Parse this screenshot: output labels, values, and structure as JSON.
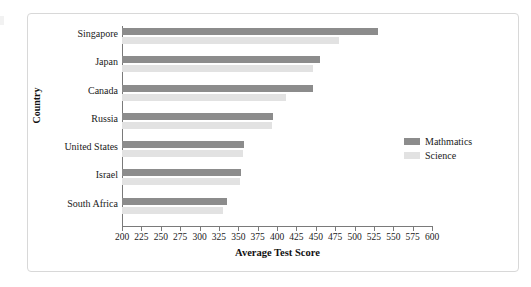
{
  "chart_data": {
    "type": "bar",
    "orientation": "horizontal",
    "title": "",
    "xlabel": "Average Test Score",
    "ylabel": "Country",
    "xlim": [
      200,
      600
    ],
    "xticks": [
      200,
      225,
      250,
      275,
      300,
      325,
      350,
      375,
      400,
      425,
      450,
      475,
      500,
      525,
      550,
      575,
      600
    ],
    "grid": false,
    "legend_position": "right",
    "categories": [
      "Singapore",
      "Japan",
      "Canada",
      "Russia",
      "United States",
      "Israel",
      "South Africa"
    ],
    "series": [
      {
        "name": "Mathmatics",
        "color": "#8c8c8c",
        "values": [
          530,
          456,
          446,
          395,
          358,
          354,
          335
        ]
      },
      {
        "name": "Science",
        "color": "#e2e2e2",
        "values": [
          480,
          447,
          411,
          393,
          356,
          352,
          330
        ]
      }
    ]
  },
  "legend": {
    "items": [
      {
        "label": "Mathmatics",
        "color": "#8c8c8c"
      },
      {
        "label": "Science",
        "color": "#e2e2e2"
      }
    ]
  }
}
